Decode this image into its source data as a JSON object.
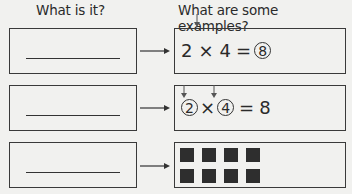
{
  "headers": {
    "left": "What is it?",
    "right": "What are some examples?"
  },
  "rows": [
    {
      "left_blank": "",
      "example": {
        "type": "equation",
        "parts": [
          "2",
          "×",
          "4",
          "=",
          "8"
        ],
        "circled": [
          4
        ]
      }
    },
    {
      "left_blank": "",
      "example": {
        "type": "equation",
        "parts": [
          "2",
          "×",
          "4",
          "=",
          "8"
        ],
        "circled": [
          0,
          2
        ]
      }
    },
    {
      "left_blank": "",
      "example": {
        "type": "array",
        "rows": 2,
        "cols": 4
      }
    }
  ],
  "eq1": {
    "a": "2",
    "op": "×",
    "b": "4",
    "eq": "=",
    "c": "8"
  },
  "eq2": {
    "a": "2",
    "op": "×",
    "b": "4",
    "eq": "=",
    "c": "8"
  },
  "colors": {
    "ink": "#2e2e2e",
    "paper": "#f1f1ef"
  }
}
